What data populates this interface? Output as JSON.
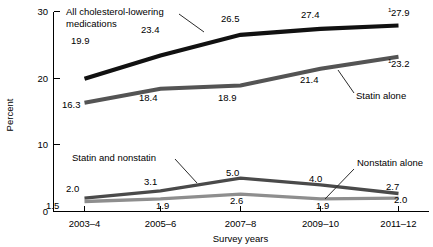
{
  "chart_data": {
    "type": "line",
    "title": "",
    "xlabel": "Survey years",
    "ylabel": "Percent",
    "categories": [
      "2003–4",
      "2005–6",
      "2007–8",
      "2009–10",
      "2011–12"
    ],
    "ylim": [
      0,
      30
    ],
    "yticks": [
      0,
      10,
      20,
      30
    ],
    "ytick_labels": [
      "0",
      "10",
      "20",
      "30"
    ],
    "grid": false,
    "legend": "inline-annotations",
    "series": [
      {
        "name": "All cholesterol-lowering medications",
        "color": "#111111",
        "width": 4.2,
        "values": [
          19.9,
          23.4,
          26.5,
          27.4,
          27.9
        ],
        "labels": [
          "19.9",
          "23.4",
          "26.5",
          "27.4",
          "27.9"
        ],
        "footnote_marks": [
          "",
          "",
          "",
          "",
          "1"
        ]
      },
      {
        "name": "Statin alone",
        "color": "#545454",
        "width": 4.0,
        "values": [
          16.3,
          18.4,
          18.9,
          21.4,
          23.2
        ],
        "labels": [
          "16.3",
          "18.4",
          "18.9",
          "21.4",
          "23.2"
        ],
        "footnote_marks": [
          "",
          "",
          "",
          "",
          "1"
        ]
      },
      {
        "name": "Statin and nonstatin",
        "color": "#4a4a4a",
        "width": 3.4,
        "values": [
          2.0,
          3.1,
          5.0,
          4.0,
          2.7
        ],
        "labels": [
          "2.0",
          "3.1",
          "5.0",
          "4.0",
          "2.7"
        ],
        "footnote_marks": [
          "",
          "",
          "",
          "",
          ""
        ]
      },
      {
        "name": "Nonstatin alone",
        "color": "#8e8e8e",
        "width": 3.4,
        "values": [
          1.5,
          1.9,
          2.6,
          1.9,
          2.0
        ],
        "labels": [
          "1.5",
          "1.9",
          "2.6",
          "1.9",
          "2.0"
        ],
        "footnote_marks": [
          "",
          "",
          "",
          "",
          ""
        ]
      }
    ],
    "annotations": [
      {
        "id": "all-meds",
        "text_line1": "All cholesterol-lowering",
        "text_line2": "medications"
      },
      {
        "id": "statin-alone",
        "text_line1": "Statin alone",
        "text_line2": ""
      },
      {
        "id": "statin-and-nonstatin",
        "text_line1": "Statin and nonstatin",
        "text_line2": ""
      },
      {
        "id": "nonstatin-alone",
        "text_line1": "Nonstatin alone",
        "text_line2": ""
      }
    ]
  }
}
